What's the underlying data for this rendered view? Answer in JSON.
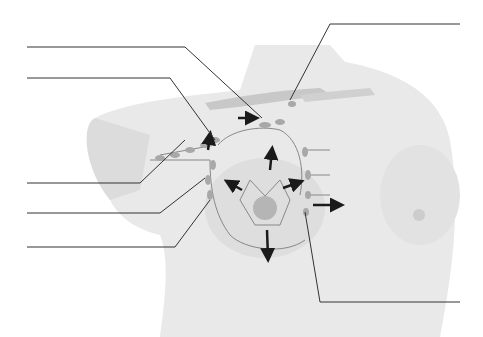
{
  "diagram": {
    "labels": [
      {
        "id": "label-1",
        "text": ""
      },
      {
        "id": "label-2",
        "text": ""
      },
      {
        "id": "label-3",
        "text": ""
      },
      {
        "id": "label-4",
        "text": ""
      },
      {
        "id": "label-5",
        "text": ""
      },
      {
        "id": "label-6",
        "text": ""
      },
      {
        "id": "label-7",
        "text": ""
      }
    ],
    "colors": {
      "skin": "#e9e9e9",
      "skin_shadow": "#dcdcdc",
      "bone": "#c8c8c8",
      "node": "#a8a8a8",
      "vessel": "#888888",
      "arrow": "#1a1a1a",
      "leader": "#333333"
    }
  }
}
